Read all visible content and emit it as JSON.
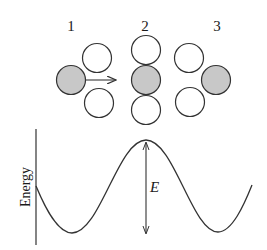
{
  "figure": {
    "stages": [
      {
        "label": "1"
      },
      {
        "label": "2"
      },
      {
        "label": "3"
      }
    ],
    "energy_axis_label": "Energy",
    "barrier_label": "E",
    "colors": {
      "shaded_atom": "#c8c8c8",
      "open_atom": "#ffffff",
      "stroke": "#333333"
    }
  }
}
